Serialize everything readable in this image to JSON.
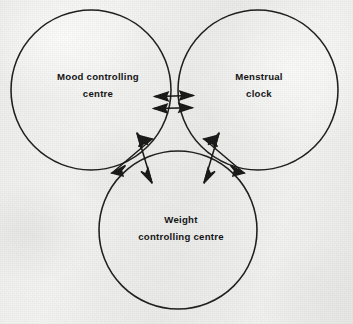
{
  "figure": {
    "kind": "hand-drawn scanned diagram",
    "width": 353,
    "height": 324,
    "background_color": "#f1f1ef",
    "ink_color": "#1a1a1a"
  },
  "circles": [
    {
      "id": "mood-controlling-centre",
      "label_line_1": "Mood controlling",
      "label_line_2": "centre",
      "cx": 91,
      "cy": 90,
      "r": 80,
      "label_x": 98,
      "label_y": 85
    },
    {
      "id": "menstrual-clock",
      "label_line_1": "Menstrual",
      "label_line_2": "clock",
      "cx": 258,
      "cy": 90,
      "r": 80,
      "label_x": 259,
      "label_y": 85
    },
    {
      "id": "weight-controlling-centre",
      "label_line_1": "Weight",
      "label_line_2": "controlling centre",
      "cx": 178,
      "cy": 230,
      "r": 79,
      "label_x": 181,
      "label_y": 228
    }
  ],
  "arrow_clusters": [
    {
      "id": "mood-menstrual-link",
      "between": "Mood controlling centre and Menstrual clock",
      "arrow_count": 2,
      "orientation": "horizontal double-headed pair"
    },
    {
      "id": "mood-weight-link",
      "between": "Mood controlling centre and Weight controlling centre",
      "arrow_count": 2,
      "orientation": "crossed diagonal double-headed pair"
    },
    {
      "id": "menstrual-weight-link",
      "between": "Menstrual clock and Weight controlling centre",
      "arrow_count": 2,
      "orientation": "crossed diagonal double-headed pair"
    }
  ]
}
